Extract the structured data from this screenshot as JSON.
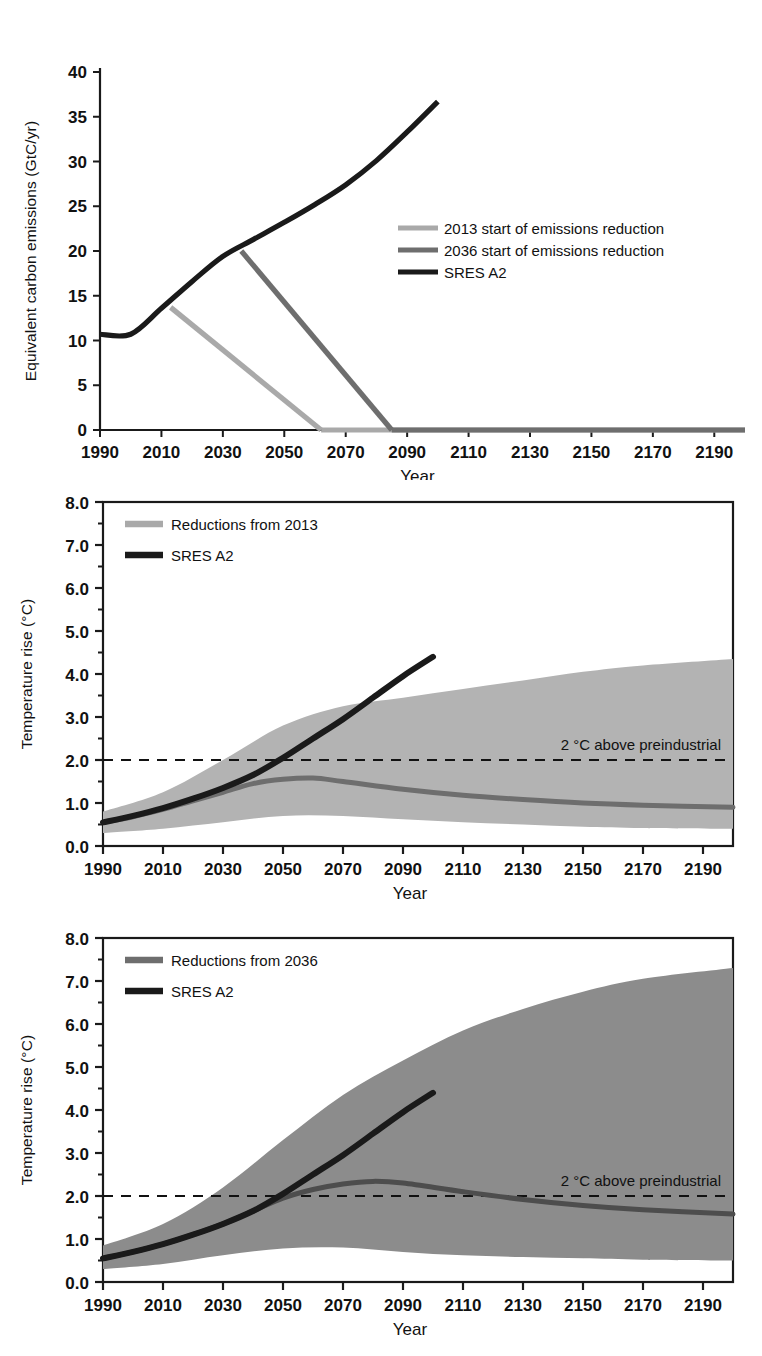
{
  "figure": {
    "panel_count": 3,
    "colors": {
      "dark": "#1a1a1a",
      "mid_gray": "#6e6e6e",
      "light_gray": "#a9a9a9",
      "band_light": "#b3b3b3",
      "band_dark": "#8c8c8c",
      "background": "#ffffff"
    }
  },
  "panel1": {
    "name": "emissions-pathways",
    "ylabel": "Equivalent carbon emissions (GtC/yr)",
    "xlabel": "Year",
    "yticks": [
      "0",
      "5",
      "10",
      "15",
      "20",
      "25",
      "30",
      "35",
      "40"
    ],
    "xticks": [
      "1990",
      "2010",
      "2030",
      "2050",
      "2070",
      "2090",
      "2110",
      "2130",
      "2150",
      "2170",
      "2190"
    ],
    "legend": [
      {
        "label": "2013 start of emissions reduction",
        "color": "#a9a9a9"
      },
      {
        "label": "2036 start of emissions reduction",
        "color": "#6e6e6e"
      },
      {
        "label": "SRES A2",
        "color": "#1a1a1a"
      }
    ]
  },
  "panel2": {
    "name": "temperature-reductions-2013",
    "ylabel": "Temperature rise (°C)",
    "xlabel": "Year",
    "yticks": [
      "0.0",
      "1.0",
      "2.0",
      "3.0",
      "4.0",
      "5.0",
      "6.0",
      "7.0",
      "8.0"
    ],
    "xticks": [
      "1990",
      "2010",
      "2030",
      "2050",
      "2070",
      "2090",
      "2110",
      "2130",
      "2150",
      "2170",
      "2190"
    ],
    "legend": [
      {
        "label": "Reductions from 2013",
        "color": "#a9a9a9"
      },
      {
        "label": "SRES A2",
        "color": "#1a1a1a"
      }
    ],
    "annotation": "2 °C  above preindustrial",
    "threshold_value": 2.0
  },
  "panel3": {
    "name": "temperature-reductions-2036",
    "ylabel": "Temperature rise (°C)",
    "xlabel": "Year",
    "yticks": [
      "0.0",
      "1.0",
      "2.0",
      "3.0",
      "4.0",
      "5.0",
      "6.0",
      "7.0",
      "8.0"
    ],
    "xticks": [
      "1990",
      "2010",
      "2030",
      "2050",
      "2070",
      "2090",
      "2110",
      "2130",
      "2150",
      "2170",
      "2190"
    ],
    "legend": [
      {
        "label": "Reductions from 2036",
        "color": "#6e6e6e"
      },
      {
        "label": "SRES A2",
        "color": "#1a1a1a"
      }
    ],
    "annotation": "2 °C  above preindustrial",
    "threshold_value": 2.0
  },
  "chart_data": [
    {
      "type": "line",
      "id": "panel1",
      "title": "",
      "xlabel": "Year",
      "ylabel": "Equivalent carbon emissions (GtC/yr)",
      "xlim": [
        1990,
        2200
      ],
      "ylim": [
        0,
        40
      ],
      "xticks": [
        1990,
        2010,
        2030,
        2050,
        2070,
        2090,
        2110,
        2130,
        2150,
        2170,
        2190
      ],
      "yticks": [
        0,
        5,
        10,
        15,
        20,
        25,
        30,
        35,
        40
      ],
      "grid": false,
      "legend_position": "center-right",
      "series": [
        {
          "name": "SRES A2",
          "color": "#1a1a1a",
          "x": [
            1990,
            2000,
            2010,
            2020,
            2030,
            2040,
            2050,
            2060,
            2070,
            2080,
            2090,
            2100
          ],
          "y": [
            10.7,
            10.7,
            13.6,
            16.6,
            19.4,
            21.3,
            23.2,
            25.2,
            27.4,
            30.1,
            33.3,
            36.7
          ]
        },
        {
          "name": "2013 start of emissions reduction",
          "color": "#a9a9a9",
          "x": [
            2013,
            2062
          ],
          "y": [
            13.7,
            0.0
          ]
        },
        {
          "name": "2036 start of emissions reduction",
          "color": "#6e6e6e",
          "x": [
            2036,
            2085
          ],
          "y": [
            20.0,
            0.0
          ]
        },
        {
          "name": "2013 reduction floor",
          "color": "#a9a9a9",
          "x": [
            2062,
            2200
          ],
          "y": [
            0.0,
            0.0
          ]
        },
        {
          "name": "2036 reduction floor",
          "color": "#6e6e6e",
          "x": [
            2085,
            2200
          ],
          "y": [
            0.0,
            0.0
          ]
        }
      ]
    },
    {
      "type": "line",
      "id": "panel2",
      "title": "",
      "xlabel": "Year",
      "ylabel": "Temperature rise (°C)",
      "xlim": [
        1990,
        2200
      ],
      "ylim": [
        0.0,
        8.0
      ],
      "xticks": [
        1990,
        2010,
        2030,
        2050,
        2070,
        2090,
        2110,
        2130,
        2150,
        2170,
        2190
      ],
      "yticks": [
        0.0,
        1.0,
        2.0,
        3.0,
        4.0,
        5.0,
        6.0,
        7.0,
        8.0
      ],
      "grid": false,
      "legend_position": "top-left",
      "annotations": [
        {
          "text": "2 °C  above preindustrial",
          "y": 2.0,
          "x": 2120,
          "style": "dashed-hline"
        }
      ],
      "bands": [
        {
          "name": "Reductions from 2013 uncertainty range",
          "color": "#b3b3b3",
          "x": [
            1990,
            2010,
            2030,
            2050,
            2070,
            2090,
            2110,
            2130,
            2150,
            2170,
            2200
          ],
          "upper": [
            0.8,
            1.25,
            2.0,
            2.8,
            3.25,
            3.45,
            3.65,
            3.85,
            4.05,
            4.2,
            4.35
          ],
          "lower": [
            0.3,
            0.4,
            0.55,
            0.7,
            0.7,
            0.62,
            0.55,
            0.5,
            0.45,
            0.42,
            0.4
          ]
        }
      ],
      "series": [
        {
          "name": "SRES A2",
          "color": "#1a1a1a",
          "x": [
            1990,
            2000,
            2010,
            2020,
            2030,
            2040,
            2050,
            2060,
            2070,
            2080,
            2090,
            2100
          ],
          "y": [
            0.55,
            0.7,
            0.88,
            1.1,
            1.35,
            1.65,
            2.05,
            2.5,
            2.95,
            3.45,
            3.95,
            4.4
          ]
        },
        {
          "name": "Reductions from 2013",
          "color": "#6e6e6e",
          "x": [
            1990,
            2000,
            2010,
            2020,
            2030,
            2040,
            2050,
            2060,
            2070,
            2090,
            2110,
            2130,
            2150,
            2170,
            2200
          ],
          "y": [
            0.55,
            0.68,
            0.85,
            1.05,
            1.25,
            1.45,
            1.55,
            1.58,
            1.5,
            1.32,
            1.18,
            1.08,
            1.0,
            0.95,
            0.9
          ]
        }
      ]
    },
    {
      "type": "line",
      "id": "panel3",
      "title": "",
      "xlabel": "Year",
      "ylabel": "Temperature rise (°C)",
      "xlim": [
        1990,
        2200
      ],
      "ylim": [
        0.0,
        8.0
      ],
      "xticks": [
        1990,
        2010,
        2030,
        2050,
        2070,
        2090,
        2110,
        2130,
        2150,
        2170,
        2190
      ],
      "yticks": [
        0.0,
        1.0,
        2.0,
        3.0,
        4.0,
        5.0,
        6.0,
        7.0,
        8.0
      ],
      "grid": false,
      "legend_position": "top-left",
      "annotations": [
        {
          "text": "2 °C  above preindustrial",
          "y": 2.0,
          "x": 2120,
          "style": "dashed-hline"
        }
      ],
      "bands": [
        {
          "name": "Reductions from 2036 uncertainty range",
          "color": "#8c8c8c",
          "x": [
            1990,
            2010,
            2030,
            2050,
            2070,
            2090,
            2110,
            2130,
            2150,
            2170,
            2200
          ],
          "upper": [
            0.85,
            1.35,
            2.2,
            3.3,
            4.35,
            5.15,
            5.85,
            6.35,
            6.75,
            7.05,
            7.3
          ],
          "lower": [
            0.3,
            0.42,
            0.62,
            0.78,
            0.8,
            0.7,
            0.62,
            0.58,
            0.55,
            0.52,
            0.5
          ]
        }
      ],
      "series": [
        {
          "name": "SRES A2",
          "color": "#1a1a1a",
          "x": [
            1990,
            2000,
            2010,
            2020,
            2030,
            2040,
            2050,
            2060,
            2070,
            2080,
            2090,
            2100
          ],
          "y": [
            0.55,
            0.7,
            0.88,
            1.1,
            1.35,
            1.65,
            2.05,
            2.5,
            2.95,
            3.45,
            3.95,
            4.4
          ]
        },
        {
          "name": "Reductions from 2036",
          "color": "#4d4d4d",
          "x": [
            1990,
            2000,
            2010,
            2020,
            2030,
            2040,
            2050,
            2060,
            2070,
            2080,
            2090,
            2110,
            2130,
            2150,
            2170,
            2200
          ],
          "y": [
            0.55,
            0.7,
            0.88,
            1.1,
            1.35,
            1.65,
            1.95,
            2.15,
            2.28,
            2.34,
            2.3,
            2.1,
            1.92,
            1.78,
            1.68,
            1.58
          ]
        }
      ]
    }
  ]
}
